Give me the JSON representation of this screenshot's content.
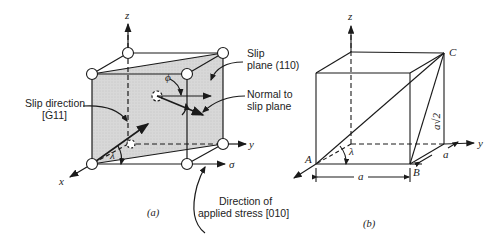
{
  "figure_a": {
    "caption": "(a)",
    "axes": {
      "x": "x",
      "y": "y",
      "z": "z"
    },
    "labels": {
      "slip_plane_line1": "Slip",
      "slip_plane_line2": "plane (110)",
      "normal_line1": "Normal to",
      "normal_line2": "slip plane",
      "slip_direction_line1": "Slip direction",
      "slip_direction_line2": "[Ġ11]",
      "stress_line1": "Direction of",
      "stress_line2": "applied stress [010]",
      "sigma": "σ",
      "phi": "ϕ",
      "lambda": "λ"
    },
    "colors": {
      "plane_fill": "#d6d6d6",
      "line": "#1a1a1a"
    }
  },
  "figure_b": {
    "caption": "(b)",
    "axes": {
      "y": "y",
      "z": "z"
    },
    "points": {
      "A": "A",
      "B": "B",
      "C": "C"
    },
    "labels": {
      "edge_a_bottom": "a",
      "edge_a_side": "a",
      "diagonal": "a√2",
      "lambda": "λ"
    }
  }
}
